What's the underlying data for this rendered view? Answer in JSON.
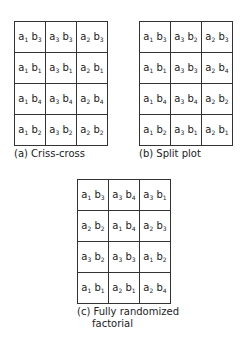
{
  "panels": [
    {
      "id": "a",
      "caption": "(a) Criss-cross",
      "rows": [
        [
          {
            "a": "1",
            "b": "3"
          },
          {
            "a": "3",
            "b": "3"
          },
          {
            "a": "2",
            "b": "3"
          }
        ],
        [
          {
            "a": "1",
            "b": "1"
          },
          {
            "a": "3",
            "b": "1"
          },
          {
            "a": "2",
            "b": "1"
          }
        ],
        [
          {
            "a": "1",
            "b": "4"
          },
          {
            "a": "3",
            "b": "4"
          },
          {
            "a": "2",
            "b": "4"
          }
        ],
        [
          {
            "a": "1",
            "b": "2"
          },
          {
            "a": "3",
            "b": "2"
          },
          {
            "a": "2",
            "b": "2"
          }
        ]
      ]
    },
    {
      "id": "b",
      "caption": "(b)  Split plot",
      "rows": [
        [
          {
            "a": "1",
            "b": "3"
          },
          {
            "a": "3",
            "b": "2"
          },
          {
            "a": "2",
            "b": "3"
          }
        ],
        [
          {
            "a": "1",
            "b": "1"
          },
          {
            "a": "3",
            "b": "3"
          },
          {
            "a": "2",
            "b": "4"
          }
        ],
        [
          {
            "a": "1",
            "b": "4"
          },
          {
            "a": "3",
            "b": "4"
          },
          {
            "a": "2",
            "b": "2"
          }
        ],
        [
          {
            "a": "1",
            "b": "2"
          },
          {
            "a": "3",
            "b": "1"
          },
          {
            "a": "2",
            "b": "1"
          }
        ]
      ]
    },
    {
      "id": "c",
      "caption": "(c) Fully randomized",
      "caption_line2": "factorial",
      "rows": [
        [
          {
            "a": "1",
            "b": "3"
          },
          {
            "a": "3",
            "b": "4"
          },
          {
            "a": "3",
            "b": "1"
          }
        ],
        [
          {
            "a": "2",
            "b": "2"
          },
          {
            "a": "1",
            "b": "4"
          },
          {
            "a": "2",
            "b": "3"
          }
        ],
        [
          {
            "a": "3",
            "b": "2"
          },
          {
            "a": "3",
            "b": "3"
          },
          {
            "a": "1",
            "b": "2"
          }
        ],
        [
          {
            "a": "1",
            "b": "1"
          },
          {
            "a": "2",
            "b": "1"
          },
          {
            "a": "2",
            "b": "4"
          }
        ]
      ]
    }
  ]
}
